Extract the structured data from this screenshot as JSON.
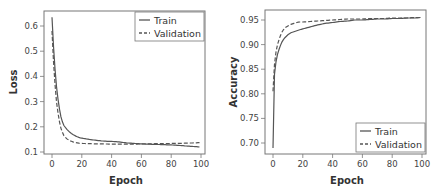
{
  "chart_data": [
    {
      "type": "line",
      "title": "",
      "xlabel": "Epoch",
      "ylabel": "Loss",
      "xlim": [
        -3,
        102
      ],
      "ylim": [
        0.09,
        0.655
      ],
      "xticks": [
        0,
        20,
        40,
        60,
        80,
        100
      ],
      "yticks": [
        0.1,
        0.2,
        0.3,
        0.4,
        0.5,
        0.6
      ],
      "ytick_labels": [
        "0.1",
        "0.2",
        "0.3",
        "0.4",
        "0.5",
        "0.6"
      ],
      "xtick_labels": [
        "0",
        "20",
        "40",
        "60",
        "80",
        "100"
      ],
      "grid": false,
      "legend_position": "upper right",
      "x": [
        0,
        1,
        2,
        3,
        4,
        5,
        6,
        7,
        8,
        10,
        12,
        14,
        16,
        18,
        20,
        25,
        30,
        35,
        40,
        45,
        50,
        55,
        60,
        65,
        70,
        75,
        80,
        85,
        90,
        95,
        99
      ],
      "series": [
        {
          "name": "Train",
          "style": "solid",
          "values": [
            0.635,
            0.52,
            0.43,
            0.36,
            0.31,
            0.27,
            0.24,
            0.22,
            0.205,
            0.19,
            0.178,
            0.17,
            0.163,
            0.158,
            0.155,
            0.15,
            0.146,
            0.143,
            0.142,
            0.14,
            0.136,
            0.134,
            0.132,
            0.131,
            0.13,
            0.129,
            0.128,
            0.126,
            0.124,
            0.122,
            0.12
          ]
        },
        {
          "name": "Validation",
          "style": "dashed",
          "values": [
            0.58,
            0.46,
            0.37,
            0.3,
            0.255,
            0.22,
            0.195,
            0.178,
            0.165,
            0.152,
            0.145,
            0.14,
            0.137,
            0.135,
            0.134,
            0.133,
            0.132,
            0.132,
            0.131,
            0.131,
            0.131,
            0.131,
            0.132,
            0.132,
            0.133,
            0.133,
            0.134,
            0.134,
            0.135,
            0.136,
            0.137
          ]
        }
      ]
    },
    {
      "type": "line",
      "title": "",
      "xlabel": "Epoch",
      "ylabel": "Accuracy",
      "xlim": [
        -3,
        102
      ],
      "ylim": [
        0.68,
        0.96
      ],
      "xticks": [
        0,
        20,
        40,
        60,
        80,
        100
      ],
      "yticks": [
        0.7,
        0.75,
        0.8,
        0.85,
        0.9,
        0.95
      ],
      "ytick_labels": [
        "0.70",
        "0.75",
        "0.80",
        "0.85",
        "0.90",
        "0.95"
      ],
      "xtick_labels": [
        "0",
        "20",
        "40",
        "60",
        "80",
        "100"
      ],
      "grid": false,
      "legend_position": "lower right",
      "x": [
        0,
        1,
        2,
        3,
        4,
        5,
        6,
        7,
        8,
        10,
        12,
        14,
        16,
        18,
        20,
        25,
        30,
        35,
        40,
        45,
        50,
        55,
        60,
        65,
        70,
        75,
        80,
        85,
        90,
        95,
        99
      ],
      "series": [
        {
          "name": "Train",
          "style": "solid",
          "values": [
            0.69,
            0.84,
            0.865,
            0.88,
            0.89,
            0.898,
            0.905,
            0.91,
            0.914,
            0.92,
            0.924,
            0.926,
            0.928,
            0.93,
            0.932,
            0.936,
            0.94,
            0.943,
            0.945,
            0.947,
            0.948,
            0.95,
            0.95,
            0.951,
            0.952,
            0.952,
            0.953,
            0.953,
            0.954,
            0.954,
            0.955
          ]
        },
        {
          "name": "Validation",
          "style": "dashed",
          "values": [
            0.805,
            0.86,
            0.885,
            0.9,
            0.91,
            0.918,
            0.925,
            0.93,
            0.934,
            0.938,
            0.941,
            0.943,
            0.945,
            0.946,
            0.946,
            0.947,
            0.948,
            0.949,
            0.95,
            0.951,
            0.952,
            0.952,
            0.952,
            0.953,
            0.953,
            0.953,
            0.954,
            0.954,
            0.954,
            0.955,
            0.955
          ]
        }
      ]
    }
  ],
  "charts": {
    "loss": {
      "ylabel": "Loss",
      "xlabel": "Epoch",
      "legend": {
        "train": "Train",
        "validation": "Validation"
      }
    },
    "accuracy": {
      "ylabel": "Accuracy",
      "xlabel": "Epoch",
      "legend": {
        "train": "Train",
        "validation": "Validation"
      }
    }
  },
  "colors": {
    "line": "#555555",
    "frame": "#777777",
    "text": "#333333"
  }
}
